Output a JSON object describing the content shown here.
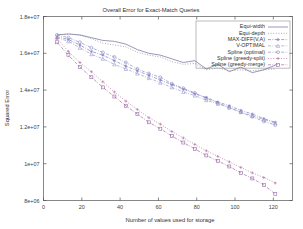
{
  "chart_data": {
    "type": "line",
    "title": "Overall Error for Exact-Match Queries",
    "xlabel": "Number of values used for storage",
    "ylabel": "Squared Error",
    "xlim": [
      0,
      130
    ],
    "ylim": [
      8000000,
      18000000
    ],
    "xticks": [
      0,
      20,
      40,
      60,
      80,
      100,
      120
    ],
    "xtick_labels": [
      "0",
      "20",
      "40",
      "60",
      "80",
      "100",
      "120"
    ],
    "yticks": [
      8000000,
      10000000,
      12000000,
      14000000,
      16000000,
      18000000
    ],
    "ytick_labels": [
      "8e+06",
      "1e+07",
      "1.2e+07",
      "1.4e+07",
      "1.6e+07",
      "1.8e+07"
    ],
    "grid": false,
    "legend_position": "top-right",
    "x": [
      7,
      13,
      19,
      25,
      31,
      37,
      43,
      49,
      55,
      61,
      67,
      73,
      79,
      85,
      91,
      97,
      103,
      109,
      115,
      121
    ],
    "series": [
      {
        "name": "Equi-width",
        "color": "#6b6b9e",
        "dash": "none",
        "marker": "none",
        "values": [
          17000000,
          17050000,
          17000000,
          16850000,
          16700000,
          16650000,
          16500000,
          16200000,
          16000000,
          15900000,
          15700000,
          15500000,
          15600000,
          15150000,
          15400000,
          15000000,
          15250000,
          14950000,
          15100000,
          15350000
        ]
      },
      {
        "name": "Equi-depth",
        "color": "#8a8a8a",
        "dash": "dotted",
        "marker": "none",
        "values": [
          17000000,
          17050000,
          16980000,
          16800000,
          16550000,
          16450000,
          16350000,
          16050000,
          15900000,
          15800000,
          15550000,
          15400000,
          15450000,
          15100000,
          15200000,
          15050000,
          15100000,
          15050000,
          15100000,
          15150000
        ]
      },
      {
        "name": "MAX-DIFF(V,A)",
        "color": "#7a7abf",
        "dash": "dashdot",
        "marker": "star",
        "values": [
          16900000,
          16750000,
          16450000,
          16100000,
          15900000,
          15600000,
          15300000,
          15050000,
          14800000,
          14550000,
          14300000,
          14050000,
          13800000,
          13600000,
          13350000,
          13150000,
          12900000,
          12700000,
          12450000,
          12250000
        ]
      },
      {
        "name": "V-OPTIMAL",
        "color": "#9b9bcf",
        "dash": "dashdot",
        "marker": "triangle",
        "values": [
          16850000,
          16650000,
          16300000,
          15950000,
          15700000,
          15400000,
          15150000,
          14900000,
          14650000,
          14400000,
          14150000,
          13900000,
          13700000,
          13450000,
          13250000,
          13050000,
          12800000,
          12600000,
          12400000,
          12200000
        ]
      },
      {
        "name": "Spline (optimal)",
        "color": "#8c8cc4",
        "dash": "dashdot",
        "marker": "circle",
        "values": [
          17000000,
          16850000,
          16600000,
          16300000,
          16050000,
          15800000,
          15500000,
          15150000,
          14900000,
          14700000,
          14350000,
          14100000,
          13850000,
          13550000,
          13300000,
          13050000,
          12800000,
          12550000,
          12300000,
          12100000
        ]
      },
      {
        "name": "Spline (greedy-split)",
        "color": "#b06a9e",
        "dash": "dotted",
        "marker": "plus",
        "values": [
          16800000,
          16100000,
          15500000,
          15000000,
          14450000,
          13900000,
          13400000,
          12950000,
          12500000,
          12150000,
          11750000,
          11400000,
          11050000,
          10700000,
          10400000,
          10100000,
          9800000,
          9500000,
          9250000,
          8950000
        ]
      },
      {
        "name": "Spline (greedy-merge)",
        "color": "#9a6aa8",
        "dash": "dashdot",
        "marker": "square",
        "values": [
          16600000,
          15900000,
          15250000,
          14700000,
          14150000,
          13650000,
          13150000,
          12700000,
          12250000,
          11900000,
          11500000,
          11150000,
          10800000,
          10450000,
          10150000,
          9850000,
          9500000,
          9200000,
          8850000,
          8350000
        ]
      }
    ]
  }
}
